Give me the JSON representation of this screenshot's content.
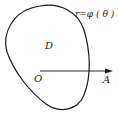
{
  "diagram": {
    "curve_label": "r=φ ( θ )",
    "region_label": "D",
    "origin_label": "O",
    "ray_end_label": "A",
    "stroke_color": "#1a1a1a"
  }
}
